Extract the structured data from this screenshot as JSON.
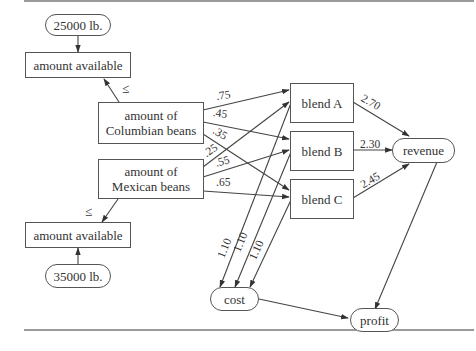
{
  "diagram": {
    "type": "influence-diagram",
    "nodes": {
      "colombian_limit": {
        "label": "25000 lb.",
        "shape": "rounded"
      },
      "colombian_available": {
        "label": "amount available",
        "shape": "rect"
      },
      "colombian_beans": {
        "label_line1": "amount of",
        "label_line2": "Columbian beans",
        "shape": "rect"
      },
      "mexican_beans": {
        "label_line1": "amount of",
        "label_line2": "Mexican beans",
        "shape": "rect"
      },
      "mexican_available": {
        "label": "amount available",
        "shape": "rect"
      },
      "mexican_limit": {
        "label": "35000 lb.",
        "shape": "rounded"
      },
      "blend_a": {
        "label": "blend A",
        "shape": "rect"
      },
      "blend_b": {
        "label": "blend B",
        "shape": "rect"
      },
      "blend_c": {
        "label": "blend C",
        "shape": "rect"
      },
      "revenue": {
        "label": "revenue",
        "shape": "rounded"
      },
      "cost": {
        "label": "cost",
        "shape": "rounded"
      },
      "profit": {
        "label": "profit",
        "shape": "rounded"
      }
    },
    "constraint_symbols": {
      "top": "≤",
      "bottom": "≤"
    },
    "edges": [
      {
        "from": "25000 lb.",
        "to": "amount available (Columbian)",
        "label": ""
      },
      {
        "from": "amount of Columbian beans",
        "to": "amount available (Columbian)",
        "label": ""
      },
      {
        "from": "amount of Mexican beans",
        "to": "amount available (Mexican)",
        "label": ""
      },
      {
        "from": "35000 lb.",
        "to": "amount available (Mexican)",
        "label": ""
      },
      {
        "from": "amount of Columbian beans",
        "to": "blend A",
        "label": ".75"
      },
      {
        "from": "amount of Columbian beans",
        "to": "blend B",
        "label": ".45"
      },
      {
        "from": "amount of Columbian beans",
        "to": "blend C",
        "label": ".35"
      },
      {
        "from": "amount of Mexican beans",
        "to": "blend A",
        "label": ".25"
      },
      {
        "from": "amount of Mexican beans",
        "to": "blend B",
        "label": ".55"
      },
      {
        "from": "amount of Mexican beans",
        "to": "blend C",
        "label": ".65"
      },
      {
        "from": "blend A",
        "to": "revenue",
        "label": "2.70"
      },
      {
        "from": "blend B",
        "to": "revenue",
        "label": "2.30"
      },
      {
        "from": "blend C",
        "to": "revenue",
        "label": "2.45"
      },
      {
        "from": "blend A",
        "to": "cost",
        "label": "1.10"
      },
      {
        "from": "blend B",
        "to": "cost",
        "label": "1.10"
      },
      {
        "from": "blend C",
        "to": "cost",
        "label": "1.10"
      },
      {
        "from": "revenue",
        "to": "profit",
        "label": ""
      },
      {
        "from": "cost",
        "to": "profit",
        "label": ""
      }
    ],
    "edge_labels": {
      "c_a": ".75",
      "c_b": ".45",
      "c_c": ".35",
      "m_a": ".25",
      "m_b": ".55",
      "m_c": ".65",
      "a_rev": "2.70",
      "b_rev": "2.30",
      "c_rev": "2.45",
      "a_cost": "1.10",
      "b_cost": "1.10",
      "c_cost": "1.10"
    }
  }
}
